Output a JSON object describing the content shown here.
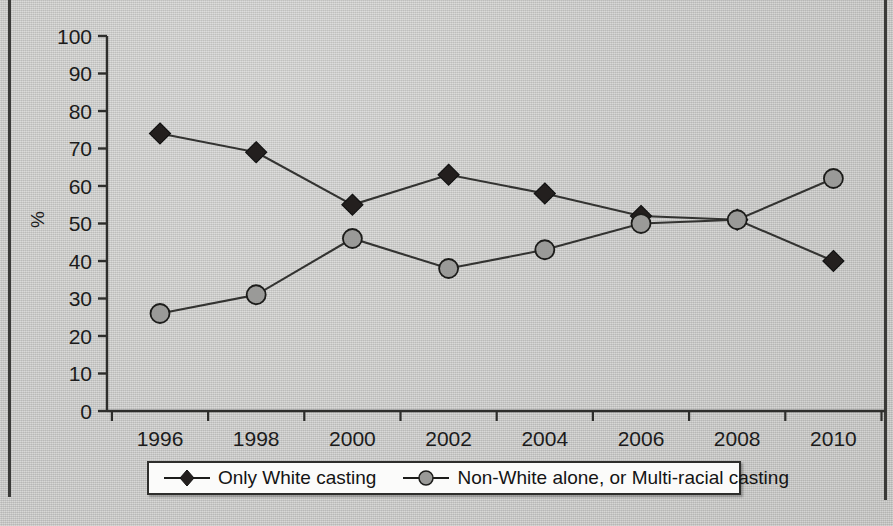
{
  "chart_data": {
    "type": "line",
    "title": "",
    "subtitle": "",
    "xlabel": "",
    "ylabel": "%",
    "categories": [
      "1996",
      "1998",
      "2000",
      "2002",
      "2004",
      "2006",
      "2008",
      "2010"
    ],
    "x": [
      1996,
      1998,
      2000,
      2002,
      2004,
      2006,
      2008,
      2010
    ],
    "ylim": [
      0,
      100
    ],
    "xlim": [
      1995,
      2011
    ],
    "yticks": [
      0,
      10,
      20,
      30,
      40,
      50,
      60,
      70,
      80,
      90,
      100
    ],
    "ytick_labels": [
      "0",
      "10",
      "20",
      "30",
      "40",
      "50",
      "60",
      "70",
      "80",
      "90",
      "100"
    ],
    "grid": false,
    "legend_position": "bottom",
    "series": [
      {
        "name": "Only White casting",
        "marker": "diamond",
        "color": "#231f1e",
        "line_color": "#333331",
        "values": [
          74,
          69,
          55,
          63,
          58,
          52,
          51,
          40
        ]
      },
      {
        "name": "Non-White alone, or Multi-racial casting",
        "marker": "circle",
        "color": "#9a9a98",
        "line_color": "#333331",
        "values": [
          26,
          31,
          46,
          38,
          43,
          50,
          51,
          62
        ]
      }
    ]
  },
  "axes": {
    "y_label": "%",
    "y_tick_labels": [
      "100",
      "90",
      "80",
      "70",
      "60",
      "50",
      "40",
      "30",
      "20",
      "10",
      "0"
    ],
    "x_tick_labels": [
      "1996",
      "1998",
      "2000",
      "2002",
      "2004",
      "2006",
      "2008",
      "2010"
    ]
  },
  "legend": {
    "items": [
      {
        "label": "Only White casting",
        "marker": "diamond-marker-icon"
      },
      {
        "label": "Non-White alone, or Multi-racial casting",
        "marker": "circle-marker-icon"
      }
    ]
  },
  "colors": {
    "page_background": "#cdcdcb",
    "border": "#3a3a38",
    "series_1": "#231f1e",
    "series_2": "#9a9a98",
    "axis": "#2e2e2c",
    "legend_background": "#fbfbfa"
  }
}
